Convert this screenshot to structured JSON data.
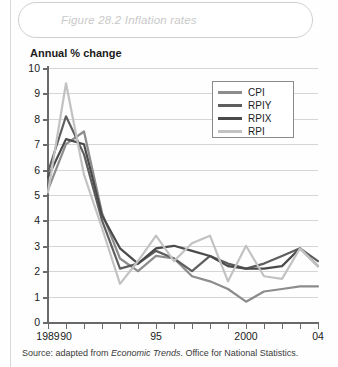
{
  "figure": {
    "title": "Figure 28.2 Inflation rates",
    "source_prefix": "Source: adapted from ",
    "source_italic": "Economic Trends",
    "source_suffix": ". Office for National Statistics."
  },
  "chart_data": {
    "type": "line",
    "title": "Figure 28.2 Inflation rates",
    "xlabel": "",
    "ylabel": "Annual % change",
    "ylim": [
      0,
      10
    ],
    "xlim": [
      1989,
      2004
    ],
    "yticks": [
      0,
      1,
      2,
      3,
      4,
      5,
      6,
      7,
      8,
      9,
      10
    ],
    "ytick_labels": [
      "0",
      "1",
      "2",
      "3",
      "4",
      "5",
      "6",
      "7",
      "8",
      "9",
      "10"
    ],
    "grid": "horizontal",
    "legend_position": "upper right",
    "x": [
      1989,
      1990,
      1991,
      1992,
      1993,
      1994,
      1995,
      1996,
      1997,
      1998,
      1999,
      2000,
      2001,
      2002,
      2003,
      2004
    ],
    "xtick_values": [
      1989,
      1990,
      1991,
      1992,
      1993,
      1994,
      1995,
      1996,
      1997,
      1998,
      1999,
      2000,
      2001,
      2002,
      2003,
      2004
    ],
    "xtick_labels": [
      {
        "value": 1989,
        "label": "1989"
      },
      {
        "value": 1990,
        "label": "90"
      },
      {
        "value": 1995,
        "label": "95"
      },
      {
        "value": 2000,
        "label": "2000"
      },
      {
        "value": 2004,
        "label": "04"
      }
    ],
    "series": [
      {
        "name": "CPI",
        "color": "#8c8c8c",
        "values": [
          5.2,
          7.0,
          7.5,
          4.3,
          2.5,
          2.0,
          2.6,
          2.5,
          1.8,
          1.6,
          1.3,
          0.8,
          1.2,
          1.3,
          1.4,
          1.4
        ]
      },
      {
        "name": "RPIY",
        "color": "#5e5e5e",
        "values": [
          5.9,
          8.1,
          6.6,
          4.0,
          2.1,
          2.3,
          2.8,
          2.5,
          2.0,
          2.6,
          2.3,
          2.1,
          2.3,
          2.6,
          2.9,
          2.4
        ]
      },
      {
        "name": "RPIX",
        "color": "#4a4a4a",
        "values": [
          5.7,
          7.2,
          7.0,
          4.2,
          2.9,
          2.3,
          2.9,
          3.0,
          2.8,
          2.6,
          2.2,
          2.1,
          2.1,
          2.2,
          2.9,
          2.2
        ]
      },
      {
        "name": "RPI",
        "color": "#c2c2c2",
        "values": [
          5.1,
          9.4,
          5.8,
          3.7,
          1.5,
          2.4,
          3.4,
          2.4,
          3.1,
          3.4,
          1.6,
          3.0,
          1.8,
          1.7,
          2.9,
          2.2
        ]
      }
    ]
  }
}
